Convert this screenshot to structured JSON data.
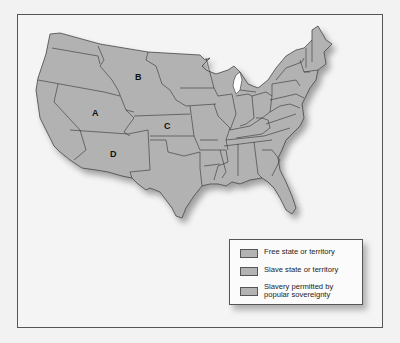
{
  "map": {
    "title": "",
    "region_labels": [
      {
        "id": "A",
        "label": "A"
      },
      {
        "id": "B",
        "label": "B"
      },
      {
        "id": "C",
        "label": "C"
      },
      {
        "id": "D",
        "label": "D"
      }
    ],
    "colors": {
      "land_fill": "#b2b2b2",
      "border": "#333333",
      "background": "#f4f4f4",
      "lake": "#ffffff"
    }
  },
  "legend": {
    "items": [
      {
        "label": "Free state or territory"
      },
      {
        "label": "Slave state or territory"
      },
      {
        "label": "Slavery permitted by\npopular sovereignty"
      }
    ]
  }
}
